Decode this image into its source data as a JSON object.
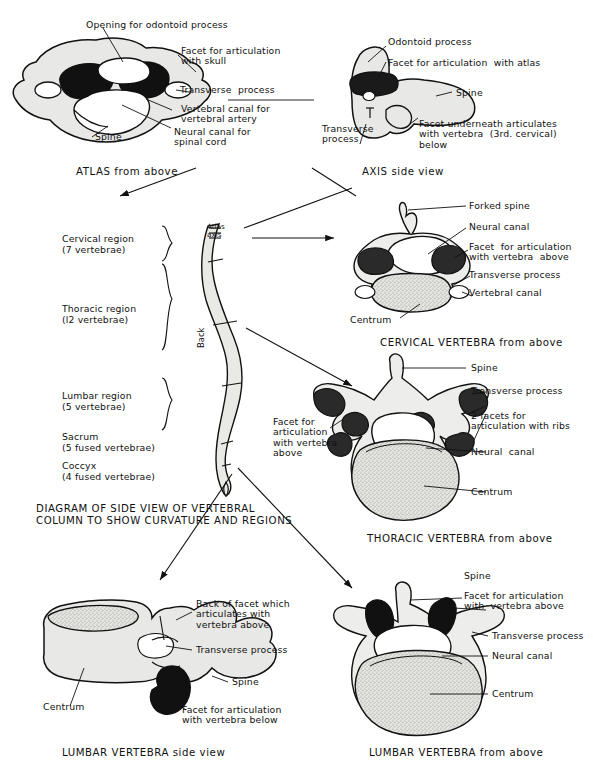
{
  "figure": {
    "background_color": "#ffffff",
    "ink_color": "#111111",
    "bone_fill": "#e8e8e6",
    "facet_fill": "#1a1a1a",
    "centrum_fill": "#dcdcd8"
  },
  "panels": {
    "atlas_above": {
      "caption": "ATLAS from above",
      "labels": {
        "opening": "Opening for odontoid process",
        "facet_skull": "Facet for articulation\nwith skull",
        "transverse": "Transverse  process",
        "vertebral_canal": "Vertebral canal for\nvertebral artery",
        "neural_canal": "Neural canal for\nspinal cord",
        "spine": "Spine"
      }
    },
    "axis_side": {
      "caption": "AXIS side view",
      "labels": {
        "odontoid": "Odontoid process",
        "facet_atlas": "Facet for articulation  with atlas",
        "spine": "Spine",
        "transverse": "Transverse\nprocess",
        "facet_underneath": "Facet underneath articulates\nwith vertebra  (3rd. cervical)\nbelow"
      }
    },
    "column": {
      "caption": "DIAGRAM OF SIDE VIEW OF VERTEBRAL\nCOLUMN TO SHOW CURVATURE AND REGIONS",
      "atlas_axis_label": "Atlas\naxis",
      "back_label": "Back",
      "regions": [
        {
          "name": "Cervical region",
          "detail": "(7 vertebrae)",
          "bracket": true
        },
        {
          "name": "Thoracic region",
          "detail": "(l2 vertebrae)",
          "bracket": true
        },
        {
          "name": "Lumbar region",
          "detail": "(5 vertebrae)",
          "bracket": true
        },
        {
          "name": "Sacrum",
          "detail": "(5 fused vertebrae)",
          "bracket": false
        },
        {
          "name": "Coccyx",
          "detail": "(4 fused vertebrae)",
          "bracket": false
        }
      ]
    },
    "cervical_above": {
      "caption": "CERVICAL VERTEBRA from above",
      "labels": {
        "forked_spine": "Forked spine",
        "neural_canal": "Neural canal",
        "facet_above": "Facet  for articulation\nwith vertebra  above",
        "transverse": "Transverse process",
        "vertebral_canal": "Vertebral canal",
        "centrum": "Centrum"
      }
    },
    "thoracic_above": {
      "caption": "THORACIC VERTEBRA from above",
      "labels": {
        "spine": "Spine",
        "transverse": "Transverse process",
        "two_facets": "2 facets for\narticulation with ribs",
        "neural_canal": "Neural  canal",
        "centrum": "Centrum",
        "facet_above": "Facet for\narticulation\nwith vertebra\nabove"
      }
    },
    "lumbar_side": {
      "caption": "LUMBAR VERTEBRA side view",
      "labels": {
        "back_of_facet": "Back of facet which\narticulates with\nvertebra above",
        "transverse": "Transverse process",
        "spine": "Spine",
        "facet_below": "Facet for articulation\nwith vertebra below",
        "centrum": "Centrum"
      }
    },
    "lumbar_above": {
      "caption": "LUMBAR VERTEBRA from above",
      "labels": {
        "spine": "Spine",
        "facet_above": "Facet for articulation\nwith  vertebra above",
        "transverse": "Transverse process",
        "neural_canal": "Neural canal",
        "centrum": "Centrum"
      }
    }
  }
}
